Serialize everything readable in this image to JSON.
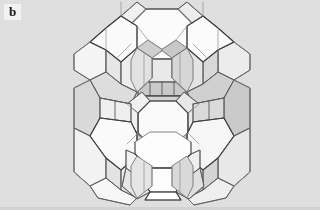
{
  "panel": {
    "label": "b",
    "caption_visible": false,
    "background_color": "#dfdfdf",
    "label_background_color": "#f2f2f2",
    "label_text_color": "#171717"
  },
  "figure": {
    "name": "zeolite-framework-polyhedral-model",
    "render_style": "line-drawing-with-flat-shading",
    "colors": {
      "face_light": "#fbfbfb",
      "face_mid": "#eeeeee",
      "face_shadow": "#d6d6d6",
      "face_deep": "#c4c4c4",
      "face_interior": "#cfcfcf",
      "edge_light": "#8d8d93",
      "edge_mid": "#6e6e74",
      "edge_dark": "#3c3c42",
      "background": "#dfdfdf"
    },
    "geometry": {
      "center_x": 162,
      "center_y": 103,
      "bounds": {
        "x": 72,
        "y": 8,
        "width": 181,
        "height": 187
      },
      "cage_count": 6,
      "cage_type": "sodalite (truncated octahedron)",
      "linker_type": "hexagonal prism (double 6-ring)",
      "central_window_ring_size": 12
    }
  }
}
